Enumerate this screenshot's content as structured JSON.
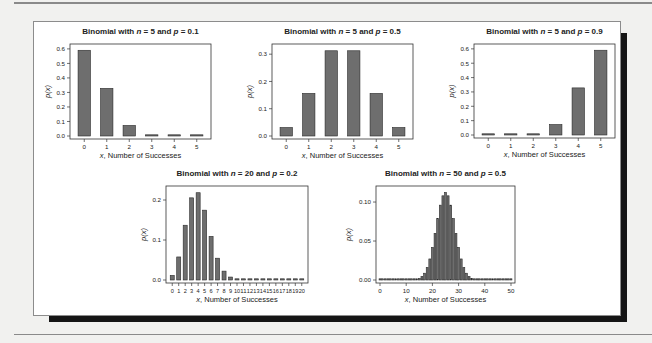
{
  "figure": {
    "colors": {
      "bar_fill": "#6e6e6e",
      "bar_stroke": "#2a2a2a",
      "axis": "#333333",
      "frame_shadow": "#151515"
    }
  },
  "chart_data": [
    {
      "type": "bar",
      "title": "Binomial with n = 5 and p = 0.1",
      "title_parts": {
        "prefix": "Binomial with ",
        "n_var": "n",
        "n_text": " = 5 and ",
        "p_var": "p",
        "p_text": " = 0.1"
      },
      "xlabel": "x, Number of Successes",
      "xlabel_parts": {
        "var": "x",
        "rest": ", Number of Successes"
      },
      "ylabel": "p(x)",
      "categories": [
        0,
        1,
        2,
        3,
        4,
        5
      ],
      "values": [
        0.5905,
        0.3281,
        0.0729,
        0.0081,
        0.0005,
        0.0
      ],
      "ylim": [
        0,
        0.62
      ],
      "yticks": [
        0.0,
        0.1,
        0.2,
        0.3,
        0.4,
        0.5,
        0.6
      ],
      "ytick_labels": [
        "0.0",
        "0.1",
        "0.2",
        "0.3",
        "0.4",
        "0.5",
        "0.6"
      ],
      "xtick_labels": [
        "0",
        "1",
        "2",
        "3",
        "4",
        "5"
      ],
      "grid": false
    },
    {
      "type": "bar",
      "title": "Binomial with n = 5 and p = 0.5",
      "title_parts": {
        "prefix": "Binomial with ",
        "n_var": "n",
        "n_text": " = 5 and ",
        "p_var": "p",
        "p_text": " = 0.5"
      },
      "xlabel": "x, Number of Successes",
      "xlabel_parts": {
        "var": "x",
        "rest": ", Number of Successes"
      },
      "ylabel": "p(x)",
      "categories": [
        0,
        1,
        2,
        3,
        4,
        5
      ],
      "values": [
        0.03125,
        0.15625,
        0.3125,
        0.3125,
        0.15625,
        0.03125
      ],
      "ylim": [
        0,
        0.33
      ],
      "yticks": [
        0.0,
        0.1,
        0.2,
        0.3
      ],
      "ytick_labels": [
        "0.0",
        "0.1",
        "0.2",
        "0.3"
      ],
      "xtick_labels": [
        "0",
        "1",
        "2",
        "3",
        "4",
        "5"
      ],
      "grid": false
    },
    {
      "type": "bar",
      "title": "Binomial with n = 5 and p = 0.9",
      "title_parts": {
        "prefix": "Binomial with ",
        "n_var": "n",
        "n_text": " = 5 and ",
        "p_var": "p",
        "p_text": " = 0.9"
      },
      "xlabel": "x, Number of Successes",
      "xlabel_parts": {
        "var": "x",
        "rest": ", Number of Successes"
      },
      "ylabel": "p(x)",
      "categories": [
        0,
        1,
        2,
        3,
        4,
        5
      ],
      "values": [
        0.0,
        0.0005,
        0.0081,
        0.0729,
        0.3281,
        0.5905
      ],
      "ylim": [
        0,
        0.62
      ],
      "yticks": [
        0.0,
        0.1,
        0.2,
        0.3,
        0.4,
        0.5,
        0.6
      ],
      "ytick_labels": [
        "0.0",
        "0.1",
        "0.2",
        "0.3",
        "0.4",
        "0.5",
        "0.6"
      ],
      "xtick_labels": [
        "0",
        "1",
        "2",
        "3",
        "4",
        "5"
      ],
      "grid": false
    },
    {
      "type": "bar",
      "title": "Binomial with n = 20 and p = 0.2",
      "title_parts": {
        "prefix": "Binomial with ",
        "n_var": "n",
        "n_text": " = 20 and ",
        "p_var": "p",
        "p_text": " = 0.2"
      },
      "xlabel": "x, Number of Successes",
      "xlabel_parts": {
        "var": "x",
        "rest": ", Number of Successes"
      },
      "ylabel": "p(x)",
      "categories": [
        0,
        1,
        2,
        3,
        4,
        5,
        6,
        7,
        8,
        9,
        10,
        11,
        12,
        13,
        14,
        15,
        16,
        17,
        18,
        19,
        20
      ],
      "values": [
        0.0115,
        0.0576,
        0.1369,
        0.2054,
        0.2182,
        0.1746,
        0.1091,
        0.0545,
        0.0222,
        0.0074,
        0.002,
        0.0005,
        0.0001,
        0.0,
        0.0,
        0.0,
        0.0,
        0.0,
        0.0,
        0.0,
        0.0
      ],
      "ylim": [
        0,
        0.23
      ],
      "yticks": [
        0.0,
        0.1,
        0.2
      ],
      "ytick_labels": [
        "0.0",
        "0.1",
        "0.2"
      ],
      "xtick_labels": [
        "0",
        "1",
        "2",
        "3",
        "4",
        "5",
        "6",
        "7",
        "8",
        "9",
        "10",
        "11",
        "12",
        "13",
        "14",
        "15",
        "16",
        "17",
        "18",
        "19",
        "20"
      ],
      "grid": false
    },
    {
      "type": "bar",
      "title": "Binomial with n = 50 and p = 0.5",
      "title_parts": {
        "prefix": "Binomial with ",
        "n_var": "n",
        "n_text": " = 50 and ",
        "p_var": "p",
        "p_text": " = 0.5"
      },
      "xlabel": "x, Number of Successes",
      "xlabel_parts": {
        "var": "x",
        "rest": ", Number of Successes"
      },
      "ylabel": "p(x)",
      "categories": [
        0,
        1,
        2,
        3,
        4,
        5,
        6,
        7,
        8,
        9,
        10,
        11,
        12,
        13,
        14,
        15,
        16,
        17,
        18,
        19,
        20,
        21,
        22,
        23,
        24,
        25,
        26,
        27,
        28,
        29,
        30,
        31,
        32,
        33,
        34,
        35,
        36,
        37,
        38,
        39,
        40,
        41,
        42,
        43,
        44,
        45,
        46,
        47,
        48,
        49,
        50
      ],
      "values": [
        0,
        0,
        0,
        0,
        0,
        0,
        0,
        0,
        0,
        0,
        0.0,
        0.0,
        0.0,
        0.0001,
        0.0003,
        0.002,
        0.0044,
        0.0087,
        0.016,
        0.027,
        0.0419,
        0.0598,
        0.0788,
        0.096,
        0.108,
        0.1123,
        0.108,
        0.096,
        0.0788,
        0.0598,
        0.0419,
        0.027,
        0.016,
        0.0087,
        0.0044,
        0.002,
        0.0003,
        0.0001,
        0.0,
        0.0,
        0,
        0,
        0,
        0,
        0,
        0,
        0,
        0,
        0,
        0,
        0
      ],
      "ylim": [
        0,
        0.118
      ],
      "yticks": [
        0.0,
        0.05,
        0.1
      ],
      "ytick_labels": [
        "0.00",
        "0.05",
        "0.10"
      ],
      "xticks": [
        0,
        10,
        20,
        30,
        40,
        50
      ],
      "xtick_labels": [
        "0",
        "10",
        "20",
        "30",
        "40",
        "50"
      ],
      "grid": false
    }
  ]
}
